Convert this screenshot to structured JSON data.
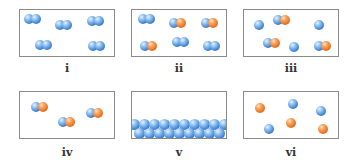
{
  "panels": [
    {
      "id": "i",
      "label": "i",
      "description": "diatomic molecules of one element"
    },
    {
      "id": "ii",
      "label": "ii",
      "description": "mixture of diatomic element molecules and compound molecules"
    },
    {
      "id": "iii",
      "label": "iii",
      "description": "mixture of single atoms and compound molecules"
    },
    {
      "id": "iv",
      "label": "iv",
      "description": "molecules of one compound"
    },
    {
      "id": "v",
      "label": "v",
      "description": "solid of one element"
    },
    {
      "id": "vi",
      "label": "vi",
      "description": "mixture of two kinds of single atoms"
    }
  ],
  "colors": {
    "atom_a": "#3b7fd0",
    "atom_b": "#ea6d1e",
    "border": "#8a8a8a"
  }
}
